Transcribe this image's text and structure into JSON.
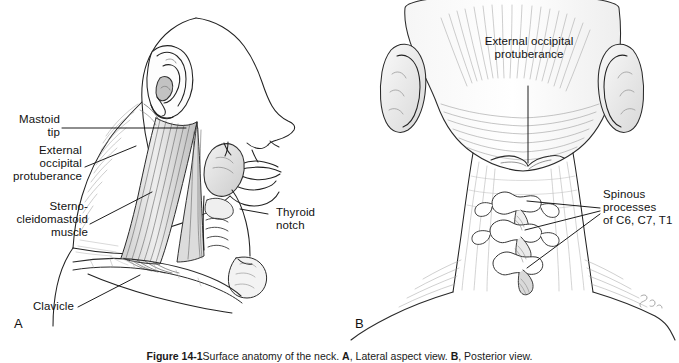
{
  "figure": {
    "caption_figure_number": "Figure 14-1",
    "caption_text": "Surface anatomy of the neck. ",
    "caption_a_letter": "A",
    "caption_a_text": ", Lateral aspect view. ",
    "caption_b_letter": "B",
    "caption_b_text": ", Posterior view."
  },
  "panel_a": {
    "letter": "A",
    "labels": [
      {
        "name": "mastoid-tip",
        "text": "Mastoid\ntip"
      },
      {
        "name": "external-occipital-protuberance",
        "text": "External\noccipital\nprotuberance"
      },
      {
        "name": "sternocleidomastoid-muscle",
        "text": "Sterno-\ncleidomastoid\nmuscle"
      },
      {
        "name": "clavicle",
        "text": "Clavicle"
      },
      {
        "name": "thyroid-notch",
        "text": "Thyroid\nnotch"
      }
    ]
  },
  "panel_b": {
    "letter": "B",
    "labels": [
      {
        "name": "external-occipital-protuberance",
        "text": "External occipital\nprotuberance"
      },
      {
        "name": "spinous-processes",
        "text": "Spinous\nprocesses\nof C6, C7, T1"
      }
    ]
  },
  "colors": {
    "background": "#ffffff",
    "ink": "#1a1a1a",
    "line": "#222222",
    "shade_light": "#e8e8e8",
    "shade_mid": "#c9c9c9",
    "shade_dark": "#9a9a9a"
  }
}
